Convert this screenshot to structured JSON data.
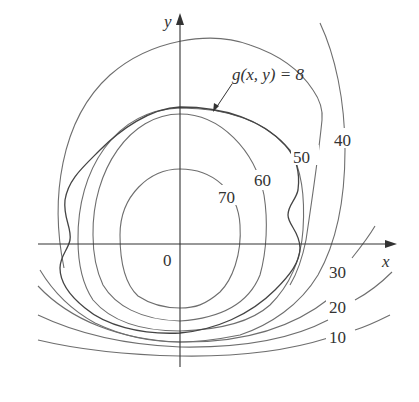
{
  "figure": {
    "type": "level curves with constraint curve",
    "axes": {
      "x_label": "x",
      "y_label": "y",
      "origin_label": "0"
    },
    "constraint": {
      "label": "g(x, y) = 8"
    },
    "level_curves": [
      {
        "value": 70,
        "label": "70"
      },
      {
        "value": 60,
        "label": "60"
      },
      {
        "value": 50,
        "label": "50"
      },
      {
        "value": 40,
        "label": "40"
      },
      {
        "value": 30,
        "label": "30"
      },
      {
        "value": 20,
        "label": "20"
      },
      {
        "value": 10,
        "label": "10"
      }
    ]
  }
}
